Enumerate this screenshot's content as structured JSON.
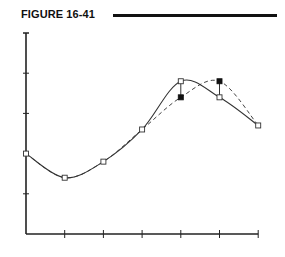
{
  "figure": {
    "label": "FIGURE 16-41"
  },
  "chart_data": {
    "type": "line",
    "title": "FIGURE 16-41",
    "xlabel": "",
    "ylabel": "",
    "x": [
      0,
      1,
      2,
      3,
      4,
      5,
      6
    ],
    "xlim": [
      0,
      6
    ],
    "ylim": [
      0,
      5
    ],
    "x_ticks": [
      1,
      2,
      3,
      4,
      5,
      6
    ],
    "y_ticks": [
      1,
      2,
      3,
      4,
      5
    ],
    "tick_labels_shown": false,
    "grid": false,
    "legend": null,
    "series": [
      {
        "name": "solid curve (open squares)",
        "style": "solid",
        "marker": "open-square",
        "points": [
          [
            0,
            2.0
          ],
          [
            1,
            1.4
          ],
          [
            2,
            1.8
          ],
          [
            3,
            2.6
          ],
          [
            4,
            3.8
          ],
          [
            5,
            3.4
          ],
          [
            6,
            2.7
          ]
        ]
      },
      {
        "name": "dashed curve (shifted peak)",
        "style": "dashed",
        "marker": "filled-square-at-deviations",
        "points": [
          [
            0,
            2.0
          ],
          [
            1,
            1.4
          ],
          [
            2,
            1.8
          ],
          [
            3,
            2.6
          ],
          [
            4,
            3.4
          ],
          [
            5,
            3.8
          ],
          [
            6,
            2.7
          ]
        ]
      }
    ],
    "annotations": [
      {
        "type": "vertical-connector",
        "x": 4,
        "from": 3.8,
        "to": 3.4
      },
      {
        "type": "vertical-connector",
        "x": 5,
        "from": 3.8,
        "to": 3.4
      }
    ]
  }
}
